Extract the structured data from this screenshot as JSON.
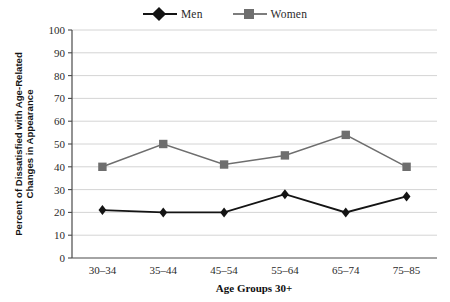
{
  "chart_data": {
    "type": "line",
    "title": "",
    "xlabel": "Age Groups 30+",
    "ylabel": "Percent of Dissatisfied with Age-Related Changes in Appearance",
    "ylabel_line1": "Percent of Dissatisfied with Age-Related",
    "ylabel_line2": "Changes in Appearance",
    "categories": [
      "30–34",
      "35–44",
      "45–54",
      "55–64",
      "65–74",
      "75–85"
    ],
    "series": [
      {
        "name": "Men",
        "values": [
          21,
          20,
          20,
          28,
          20,
          27
        ],
        "color": "#141414",
        "marker": "diamond"
      },
      {
        "name": "Women",
        "values": [
          40,
          50,
          41,
          45,
          54,
          40
        ],
        "color": "#6e6e6e",
        "marker": "square"
      }
    ],
    "ylim": [
      0,
      100
    ],
    "ytick_step": 10,
    "yticks": [
      "0",
      "10",
      "20",
      "30",
      "40",
      "50",
      "60",
      "70",
      "80",
      "90",
      "100"
    ],
    "grid": "horizontal",
    "legend_position": "top-center",
    "gridline_color": "#cfcfcf",
    "axis_color": "#4a4a4a",
    "background": "#ffffff"
  },
  "legend": {
    "entries": [
      {
        "label": "Men"
      },
      {
        "label": "Women"
      }
    ]
  }
}
